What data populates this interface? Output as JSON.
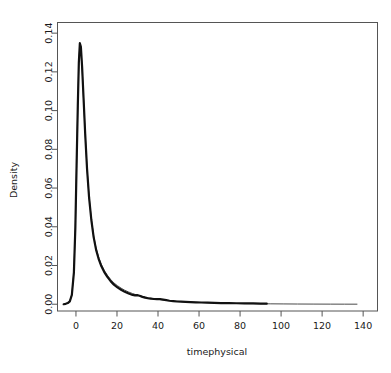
{
  "chart_data": {
    "type": "line",
    "title": "",
    "xlabel": "timephysical",
    "ylabel": "Density",
    "xlim": [
      -9,
      147
    ],
    "ylim": [
      -0.0035,
      0.1455
    ],
    "xticks": [
      0,
      20,
      40,
      60,
      80,
      100,
      120,
      140
    ],
    "xtick_labels": [
      "0",
      "20",
      "40",
      "60",
      "80",
      "100",
      "120",
      "140"
    ],
    "yticks": [
      0.0,
      0.02,
      0.04,
      0.06,
      0.08,
      0.1,
      0.12,
      0.14
    ],
    "ytick_labels": [
      "0.00",
      "0.02",
      "0.04",
      "0.06",
      "0.08",
      "0.10",
      "0.12",
      "0.14"
    ],
    "grid": false,
    "legend": "none",
    "series": [
      {
        "name": "density-thin",
        "color": "#4a4a4a",
        "width": 1.0,
        "points": [
          [
            -6.0,
            0.0
          ],
          [
            -5.0,
            0.0002
          ],
          [
            -4.0,
            0.0006
          ],
          [
            -3.0,
            0.0016
          ],
          [
            -2.0,
            0.005
          ],
          [
            -1.0,
            0.017
          ],
          [
            -0.3,
            0.04
          ],
          [
            0.3,
            0.072
          ],
          [
            0.9,
            0.103
          ],
          [
            1.4,
            0.125
          ],
          [
            1.9,
            0.134
          ],
          [
            2.4,
            0.1325
          ],
          [
            3.0,
            0.122
          ],
          [
            3.7,
            0.106
          ],
          [
            4.5,
            0.088
          ],
          [
            5.4,
            0.07
          ],
          [
            6.4,
            0.0555
          ],
          [
            7.5,
            0.044
          ],
          [
            8.6,
            0.0355
          ],
          [
            9.8,
            0.029
          ],
          [
            11.0,
            0.0245
          ],
          [
            12.4,
            0.0205
          ],
          [
            13.8,
            0.0175
          ],
          [
            15.3,
            0.015
          ],
          [
            16.9,
            0.0128
          ],
          [
            18.5,
            0.011
          ],
          [
            20.2,
            0.0096
          ],
          [
            22.0,
            0.0083
          ],
          [
            23.8,
            0.0072
          ],
          [
            25.7,
            0.0063
          ],
          [
            27.6,
            0.0055
          ],
          [
            29.6,
            0.0048
          ],
          [
            31.6,
            0.0042
          ],
          [
            33.7,
            0.0037
          ],
          [
            35.8,
            0.0032
          ],
          [
            38.0,
            0.0028
          ],
          [
            40.2,
            0.0025
          ],
          [
            42.5,
            0.0022
          ],
          [
            44.8,
            0.0019
          ],
          [
            47.2,
            0.0017
          ],
          [
            49.6,
            0.0015
          ],
          [
            52.1,
            0.0013
          ],
          [
            54.7,
            0.0012
          ],
          [
            57.3,
            0.001
          ],
          [
            60.0,
            0.0009
          ],
          [
            63.0,
            0.0008
          ],
          [
            66.0,
            0.0007
          ],
          [
            69.5,
            0.0006
          ],
          [
            73.0,
            0.0005
          ],
          [
            77.0,
            0.0004
          ],
          [
            81.0,
            0.00035
          ],
          [
            85.0,
            0.0003
          ],
          [
            90.0,
            0.00025
          ],
          [
            95.0,
            0.0002
          ],
          [
            101.0,
            0.00015
          ],
          [
            108.0,
            0.0001
          ],
          [
            116.0,
            7e-05
          ],
          [
            124.0,
            5e-05
          ],
          [
            131.0,
            3e-05
          ],
          [
            137.0,
            2e-05
          ]
        ]
      },
      {
        "name": "density-thick",
        "color": "#111111",
        "width": 2.2,
        "points": [
          [
            -6.0,
            0.0
          ],
          [
            -5.0,
            0.0002
          ],
          [
            -4.0,
            0.0006
          ],
          [
            -3.0,
            0.0015
          ],
          [
            -2.0,
            0.0048
          ],
          [
            -1.0,
            0.0165
          ],
          [
            -0.3,
            0.0395
          ],
          [
            0.3,
            0.0715
          ],
          [
            0.9,
            0.1025
          ],
          [
            1.4,
            0.1248
          ],
          [
            1.9,
            0.1348
          ],
          [
            2.4,
            0.133
          ],
          [
            3.0,
            0.1225
          ],
          [
            3.7,
            0.1065
          ],
          [
            4.5,
            0.088
          ],
          [
            5.4,
            0.07
          ],
          [
            6.4,
            0.055
          ],
          [
            7.5,
            0.0435
          ],
          [
            8.6,
            0.0348
          ],
          [
            9.8,
            0.0282
          ],
          [
            11.0,
            0.0236
          ],
          [
            12.4,
            0.0196
          ],
          [
            13.8,
            0.0166
          ],
          [
            15.3,
            0.0141
          ],
          [
            16.9,
            0.0119
          ],
          [
            18.5,
            0.0101
          ],
          [
            20.2,
            0.0087
          ],
          [
            22.0,
            0.0075
          ],
          [
            23.8,
            0.0064
          ],
          [
            25.7,
            0.0055
          ],
          [
            27.6,
            0.0048
          ],
          [
            28.8,
            0.0046
          ],
          [
            29.8,
            0.0047
          ],
          [
            31.0,
            0.0044
          ],
          [
            32.4,
            0.0038
          ],
          [
            33.7,
            0.0034
          ],
          [
            35.0,
            0.0031
          ],
          [
            36.4,
            0.0029
          ],
          [
            38.0,
            0.0027
          ],
          [
            39.5,
            0.0026
          ],
          [
            41.0,
            0.0026
          ],
          [
            42.5,
            0.0024
          ],
          [
            44.0,
            0.0021
          ],
          [
            45.6,
            0.0018
          ],
          [
            47.4,
            0.0016
          ],
          [
            49.2,
            0.0014
          ],
          [
            51.2,
            0.0013
          ],
          [
            53.4,
            0.0012
          ],
          [
            55.8,
            0.0011
          ],
          [
            58.4,
            0.001
          ],
          [
            61.2,
            0.0009
          ],
          [
            64.2,
            0.0008
          ],
          [
            67.4,
            0.0007
          ],
          [
            70.8,
            0.0006
          ],
          [
            74.4,
            0.00055
          ],
          [
            78.2,
            0.0005
          ],
          [
            82.2,
            0.00045
          ],
          [
            86.4,
            0.0004
          ],
          [
            90.0,
            0.00035
          ],
          [
            93.0,
            0.0003
          ]
        ]
      }
    ]
  },
  "figure": {
    "ghost_line": ""
  }
}
